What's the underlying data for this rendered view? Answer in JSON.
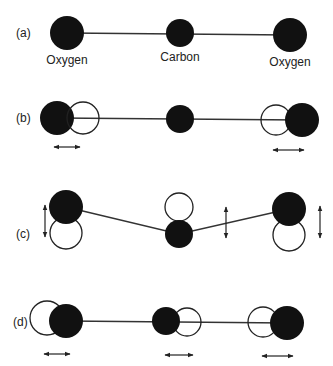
{
  "colors": {
    "atom_fill": "#111111",
    "displaced_outline": "#222222",
    "bond": "#333333",
    "background": "#ffffff"
  },
  "panels": [
    {
      "tag": "(a)",
      "labels": [
        "Oxygen",
        "Carbon",
        "Oxygen"
      ],
      "description": "equilibrium linear molecule"
    },
    {
      "tag": "(b)",
      "description": "symmetric stretch"
    },
    {
      "tag": "(c)",
      "description": "bending mode"
    },
    {
      "tag": "(d)",
      "description": "asymmetric stretch"
    }
  ]
}
